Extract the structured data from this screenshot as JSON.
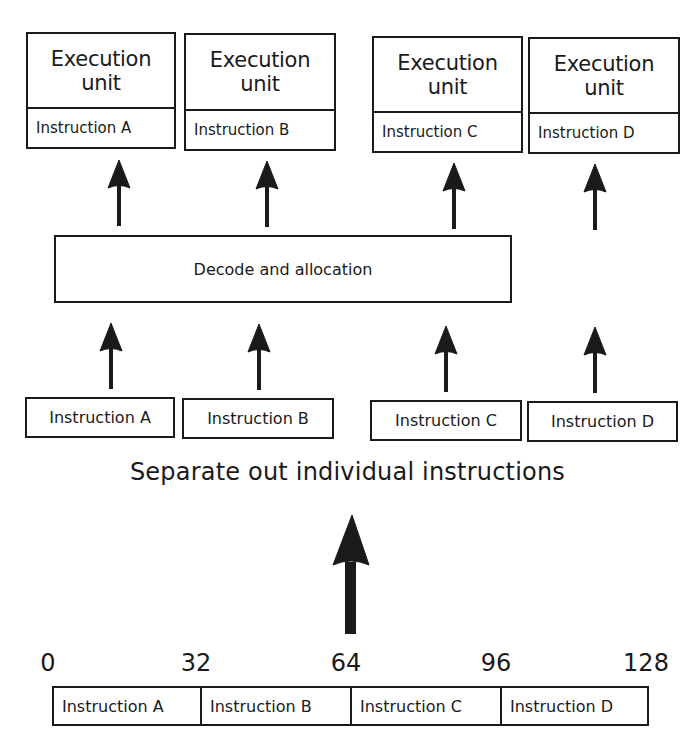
{
  "execution_units": [
    {
      "title_line1": "Execution",
      "title_line2": "unit",
      "instruction": "Instruction A"
    },
    {
      "title_line1": "Execution",
      "title_line2": "unit",
      "instruction": "Instruction B"
    },
    {
      "title_line1": "Execution",
      "title_line2": "unit",
      "instruction": "Instruction C"
    },
    {
      "title_line1": "Execution",
      "title_line2": "unit",
      "instruction": "Instruction D"
    }
  ],
  "decode_label": "Decode and allocation",
  "separated_instructions": [
    "Instruction A",
    "Instruction B",
    "Instruction C",
    "Instruction D"
  ],
  "separate_caption": "Separate out individual instructions",
  "bit_ticks": [
    "0",
    "32",
    "64",
    "96",
    "128"
  ],
  "instruction_word": [
    "Instruction A",
    "Instruction B",
    "Instruction C",
    "Instruction D"
  ],
  "colors": {
    "ink": "#1a1a1a",
    "background": "#ffffff"
  }
}
